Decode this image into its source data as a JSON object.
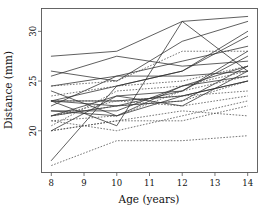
{
  "chart_data": {
    "type": "line",
    "title": "",
    "xlabel": "Age (years)",
    "ylabel": "Distance (mm)",
    "x": [
      8,
      10,
      12,
      14
    ],
    "xlim": [
      7.7,
      14.3
    ],
    "ylim": [
      15.8,
      32.3
    ],
    "xticks": [
      8,
      9,
      10,
      11,
      12,
      13,
      14
    ],
    "xticklabels": [
      "8",
      "9",
      "10",
      "11",
      "12",
      "13",
      "14"
    ],
    "yticks": [
      20,
      25,
      30
    ],
    "yticklabels": [
      "20",
      "25",
      "30"
    ],
    "grid": false,
    "legend": "none",
    "linestyles": {
      "solid": "Male subjects",
      "dotted": "Female subjects"
    },
    "series": [
      {
        "name": "M01",
        "style": "solid",
        "values": [
          26.0,
          25.0,
          29.0,
          31.0
        ]
      },
      {
        "name": "M02",
        "style": "solid",
        "values": [
          21.5,
          22.5,
          23.0,
          26.5
        ]
      },
      {
        "name": "M03",
        "style": "solid",
        "values": [
          23.0,
          22.5,
          24.0,
          27.5
        ]
      },
      {
        "name": "M04",
        "style": "solid",
        "values": [
          25.5,
          27.5,
          26.5,
          27.0
        ]
      },
      {
        "name": "M05",
        "style": "solid",
        "values": [
          20.0,
          23.5,
          22.5,
          26.0
        ]
      },
      {
        "name": "M06",
        "style": "solid",
        "values": [
          24.5,
          25.5,
          27.0,
          28.5
        ]
      },
      {
        "name": "M07",
        "style": "solid",
        "values": [
          22.0,
          22.0,
          24.5,
          26.5
        ]
      },
      {
        "name": "M08",
        "style": "solid",
        "values": [
          24.0,
          21.5,
          24.5,
          25.5
        ]
      },
      {
        "name": "M09",
        "style": "solid",
        "values": [
          23.0,
          20.5,
          31.0,
          26.0
        ]
      },
      {
        "name": "M10",
        "style": "solid",
        "values": [
          27.5,
          28.0,
          31.0,
          31.5
        ]
      },
      {
        "name": "M11",
        "style": "solid",
        "values": [
          23.0,
          23.0,
          23.5,
          25.0
        ]
      },
      {
        "name": "M12",
        "style": "solid",
        "values": [
          21.5,
          23.5,
          24.0,
          28.0
        ]
      },
      {
        "name": "M13",
        "style": "solid",
        "values": [
          17.0,
          24.5,
          26.0,
          29.5
        ]
      },
      {
        "name": "M14",
        "style": "solid",
        "values": [
          22.5,
          25.5,
          25.5,
          26.0
        ]
      },
      {
        "name": "M15",
        "style": "solid",
        "values": [
          23.0,
          24.5,
          26.0,
          30.0
        ]
      },
      {
        "name": "M16",
        "style": "solid",
        "values": [
          22.0,
          21.5,
          23.5,
          25.0
        ]
      },
      {
        "name": "F01",
        "style": "dotted",
        "values": [
          21.0,
          20.0,
          21.5,
          23.0
        ]
      },
      {
        "name": "F02",
        "style": "dotted",
        "values": [
          21.0,
          21.5,
          24.0,
          25.5
        ]
      },
      {
        "name": "F03",
        "style": "dotted",
        "values": [
          20.5,
          24.0,
          24.5,
          26.0
        ]
      },
      {
        "name": "F04",
        "style": "dotted",
        "values": [
          23.5,
          24.5,
          25.0,
          26.5
        ]
      },
      {
        "name": "F05",
        "style": "dotted",
        "values": [
          21.5,
          23.0,
          22.5,
          23.5
        ]
      },
      {
        "name": "F06",
        "style": "dotted",
        "values": [
          20.0,
          21.0,
          21.0,
          22.5
        ]
      },
      {
        "name": "F07",
        "style": "dotted",
        "values": [
          21.5,
          22.5,
          23.0,
          25.0
        ]
      },
      {
        "name": "F08",
        "style": "dotted",
        "values": [
          23.0,
          23.0,
          23.5,
          24.0
        ]
      },
      {
        "name": "F09",
        "style": "dotted",
        "values": [
          20.0,
          21.0,
          22.0,
          21.5
        ]
      },
      {
        "name": "F10",
        "style": "dotted",
        "values": [
          16.5,
          19.0,
          19.0,
          19.5
        ]
      },
      {
        "name": "F11",
        "style": "dotted",
        "values": [
          24.5,
          25.0,
          28.0,
          28.0
        ]
      }
    ]
  },
  "figure": {
    "background_color": "#ffffff",
    "line_color_solid": "#2b2b2b",
    "line_color_dotted": "#4a4a4a",
    "frame_color": "#555555"
  }
}
